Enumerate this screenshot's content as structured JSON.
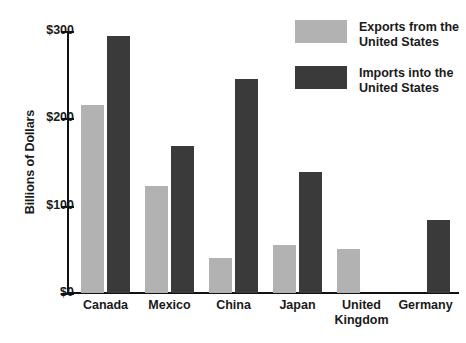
{
  "chart_data": {
    "type": "bar",
    "title": "",
    "subtitle": "",
    "xlabel": "",
    "ylabel": "Billions of Dollars",
    "categories": [
      "Canada",
      "Mexico",
      "China",
      "Japan",
      "United Kingdom",
      "Germany"
    ],
    "series": [
      {
        "name": "Exports from the United States",
        "color": "#b2b2b2",
        "values": [
          215,
          123,
          40,
          55,
          50,
          null
        ]
      },
      {
        "name": "Imports into the United States",
        "color": "#3a3a3a",
        "values": [
          294,
          168,
          245,
          138,
          null,
          84
        ]
      }
    ],
    "ylim": [
      0,
      300
    ],
    "ytick_values": [
      0,
      100,
      200,
      300
    ],
    "ytick_labels": [
      "$0",
      "$100",
      "$200",
      "$300"
    ],
    "grid": false,
    "legend_position": "top-right"
  },
  "axis": {
    "y_title": "Billions of Dollars",
    "y_ticks": [
      {
        "label": "$300",
        "value": 300
      },
      {
        "label": "$200",
        "value": 200
      },
      {
        "label": "$100",
        "value": 100
      },
      {
        "label": "$0",
        "value": 0
      }
    ]
  },
  "categories": [
    {
      "label": "Canada"
    },
    {
      "label": "Mexico"
    },
    {
      "label": "China"
    },
    {
      "label": "Japan"
    },
    {
      "label": "United\nKingdom"
    },
    {
      "label": "Germany"
    }
  ],
  "legend": {
    "items": [
      {
        "label": "Exports from the\nUnited States",
        "color": "#b2b2b2",
        "swatch": "exports-swatch"
      },
      {
        "label": "Imports into the\nUnited States",
        "color": "#3a3a3a",
        "swatch": "imports-swatch"
      }
    ]
  }
}
